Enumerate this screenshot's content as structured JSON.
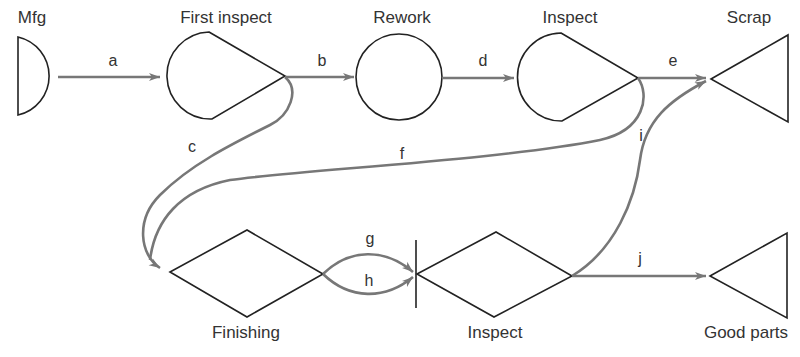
{
  "nodes": {
    "mfg": {
      "label": "Mfg",
      "shape": "half-circle"
    },
    "first_inspect": {
      "label": "First inspect",
      "shape": "teardrop"
    },
    "rework": {
      "label": "Rework",
      "shape": "circle"
    },
    "inspect_top": {
      "label": "Inspect",
      "shape": "teardrop"
    },
    "scrap": {
      "label": "Scrap",
      "shape": "triangle"
    },
    "finishing": {
      "label": "Finishing",
      "shape": "diamond"
    },
    "inspect_bottom": {
      "label": "Inspect",
      "shape": "diamond"
    },
    "good_parts": {
      "label": "Good parts",
      "shape": "triangle"
    }
  },
  "edges": {
    "a": {
      "label": "a",
      "from": "Mfg",
      "to": "First inspect"
    },
    "b": {
      "label": "b",
      "from": "First inspect",
      "to": "Rework"
    },
    "c": {
      "label": "c",
      "from": "First inspect",
      "to": "Finishing"
    },
    "d": {
      "label": "d",
      "from": "Rework",
      "to": "Inspect"
    },
    "e": {
      "label": "e",
      "from": "Inspect",
      "to": "Scrap"
    },
    "f": {
      "label": "f",
      "from": "Inspect",
      "to": "Finishing"
    },
    "g": {
      "label": "g",
      "from": "Finishing",
      "to": "Inspect"
    },
    "h": {
      "label": "h",
      "from": "Finishing",
      "to": "Inspect"
    },
    "i": {
      "label": "i",
      "from": "Inspect",
      "to": "Scrap"
    },
    "j": {
      "label": "j",
      "from": "Inspect",
      "to": "Good parts"
    }
  },
  "colors": {
    "shape_stroke": "#222222",
    "flow_stroke": "#777777",
    "text": "#333333"
  }
}
